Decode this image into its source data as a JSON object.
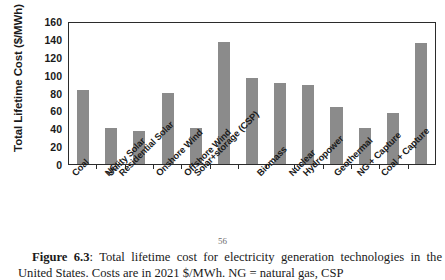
{
  "figure": {
    "page_number": "56",
    "caption_label": "Figure 6.3",
    "caption_separator": ": ",
    "caption_text": "Total lifetime cost for electricity generation technologies in the United States. Costs are in 2021 $/MWh. NG = natural gas, CSP"
  },
  "chart_data": {
    "type": "bar",
    "title": "",
    "xlabel": "",
    "ylabel": "Total Lifetime Cost ($/MWh)",
    "ylim": [
      0,
      160
    ],
    "yticks": [
      160,
      140,
      120,
      100,
      80,
      60,
      40,
      20,
      0
    ],
    "grid": false,
    "legend": "none",
    "bar_color": "#8b8b8b",
    "axis_color": "#2b2b2b",
    "categories": [
      "Coal",
      "NG",
      "Utility Solar",
      "Residential Solar",
      "Onshore Wind",
      "Offshore Wind",
      "Solar+storage (CSP)",
      "Biomass",
      "Nuclear",
      "Hydropower",
      "Geothermal",
      "NG + Capture",
      "Coal + Capture"
    ],
    "values": [
      83,
      40,
      37,
      80,
      40,
      136,
      96,
      91,
      88,
      64,
      40,
      57,
      135
    ]
  }
}
